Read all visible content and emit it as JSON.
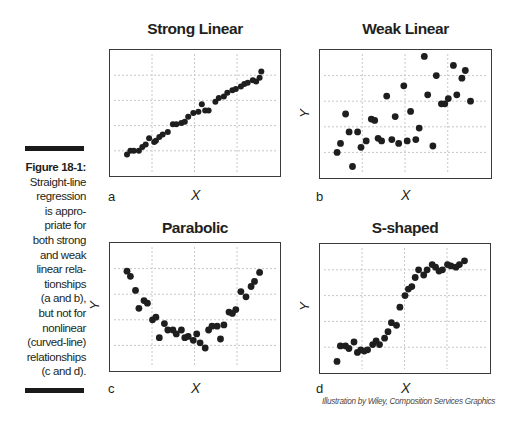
{
  "caption": {
    "figure_number": "Figure 18-1:",
    "lines": [
      "Straight-line",
      "regression",
      "is appro-",
      "priate for",
      "both strong",
      "and weak",
      "linear rela-",
      "tionships",
      "(a and b),",
      "but not for",
      "nonlinear",
      "(curved-line)",
      "relationships",
      "(c and d)."
    ]
  },
  "credit": "Illustration by Wiley, Composition Services Graphics",
  "colors": {
    "point": "#1e1e1e",
    "frame": "#3a3a3a",
    "grid": "#c8c8c8",
    "text": "#231f20"
  },
  "panels": [
    {
      "id": "a",
      "letter": "a",
      "title": "Strong Linear",
      "xlabel": "X",
      "ylabel": "Y"
    },
    {
      "id": "b",
      "letter": "b",
      "title": "Weak Linear",
      "xlabel": "X",
      "ylabel": "Y"
    },
    {
      "id": "c",
      "letter": "c",
      "title": "Parabolic",
      "xlabel": "X",
      "ylabel": "Y"
    },
    {
      "id": "d",
      "letter": "d",
      "title": "S-shaped",
      "xlabel": "X",
      "ylabel": "Y"
    }
  ],
  "chart_data": [
    {
      "type": "scatter",
      "title": "Strong Linear",
      "panel": "a",
      "xlabel": "X",
      "ylabel": "Y",
      "xlim": [
        0,
        100
      ],
      "ylim": [
        0,
        100
      ],
      "grid": true,
      "legend": null,
      "tick_labels": false,
      "points": [
        [
          10,
          17
        ],
        [
          12,
          20
        ],
        [
          14,
          20
        ],
        [
          17,
          20
        ],
        [
          19,
          23
        ],
        [
          21,
          25
        ],
        [
          23,
          30
        ],
        [
          26,
          27
        ],
        [
          27,
          28
        ],
        [
          29,
          31
        ],
        [
          31,
          33
        ],
        [
          34,
          35
        ],
        [
          37,
          41
        ],
        [
          39,
          41
        ],
        [
          42,
          42
        ],
        [
          44,
          43
        ],
        [
          46,
          47
        ],
        [
          49,
          50
        ],
        [
          52,
          51
        ],
        [
          54,
          57
        ],
        [
          56,
          52
        ],
        [
          58,
          52
        ],
        [
          62,
          59
        ],
        [
          64,
          62
        ],
        [
          67,
          63
        ],
        [
          69,
          66
        ],
        [
          72,
          68
        ],
        [
          74,
          69
        ],
        [
          77,
          71
        ],
        [
          79,
          73
        ],
        [
          81,
          74
        ],
        [
          84,
          76
        ],
        [
          86,
          75
        ],
        [
          88,
          78
        ],
        [
          89,
          83
        ]
      ]
    },
    {
      "type": "scatter",
      "title": "Weak Linear",
      "panel": "b",
      "xlabel": "X",
      "ylabel": "Y",
      "xlim": [
        0,
        100
      ],
      "ylim": [
        0,
        100
      ],
      "grid": true,
      "legend": null,
      "tick_labels": false,
      "points": [
        [
          10,
          20
        ],
        [
          12,
          27
        ],
        [
          15,
          50
        ],
        [
          17,
          36
        ],
        [
          19,
          9
        ],
        [
          22,
          36
        ],
        [
          24,
          24
        ],
        [
          27,
          29
        ],
        [
          30,
          46
        ],
        [
          32,
          45
        ],
        [
          34,
          31
        ],
        [
          36,
          29
        ],
        [
          39,
          64
        ],
        [
          42,
          30
        ],
        [
          44,
          48
        ],
        [
          46,
          27
        ],
        [
          49,
          72
        ],
        [
          51,
          29
        ],
        [
          53,
          52
        ],
        [
          56,
          30
        ],
        [
          58,
          39
        ],
        [
          61,
          95
        ],
        [
          63,
          65
        ],
        [
          66,
          25
        ],
        [
          68,
          80
        ],
        [
          71,
          58
        ],
        [
          73,
          58
        ],
        [
          75,
          62
        ],
        [
          78,
          88
        ],
        [
          80,
          65
        ],
        [
          83,
          78
        ],
        [
          85,
          84
        ],
        [
          88,
          60
        ]
      ]
    },
    {
      "type": "scatter",
      "title": "Parabolic",
      "panel": "c",
      "xlabel": "X",
      "ylabel": "Y",
      "xlim": [
        0,
        100
      ],
      "ylim": [
        0,
        100
      ],
      "grid": true,
      "legend": null,
      "tick_labels": false,
      "points": [
        [
          10,
          78
        ],
        [
          12,
          74
        ],
        [
          15,
          63
        ],
        [
          17,
          49
        ],
        [
          20,
          55
        ],
        [
          22,
          53
        ],
        [
          25,
          40
        ],
        [
          27,
          42
        ],
        [
          29,
          26
        ],
        [
          32,
          37
        ],
        [
          34,
          32
        ],
        [
          37,
          32
        ],
        [
          39,
          29
        ],
        [
          42,
          32
        ],
        [
          44,
          26
        ],
        [
          46,
          27
        ],
        [
          49,
          24
        ],
        [
          51,
          29
        ],
        [
          53,
          22
        ],
        [
          56,
          18
        ],
        [
          58,
          32
        ],
        [
          60,
          35
        ],
        [
          63,
          35
        ],
        [
          65,
          25
        ],
        [
          67,
          36
        ],
        [
          70,
          46
        ],
        [
          72,
          45
        ],
        [
          74,
          48
        ],
        [
          77,
          62
        ],
        [
          80,
          58
        ],
        [
          83,
          66
        ],
        [
          85,
          70
        ],
        [
          88,
          77
        ]
      ]
    },
    {
      "type": "scatter",
      "title": "S-shaped",
      "panel": "d",
      "xlabel": "X",
      "ylabel": "Y",
      "xlim": [
        0,
        100
      ],
      "ylim": [
        0,
        100
      ],
      "grid": true,
      "legend": null,
      "tick_labels": false,
      "points": [
        [
          10,
          9
        ],
        [
          12,
          21
        ],
        [
          15,
          21
        ],
        [
          17,
          19
        ],
        [
          20,
          24
        ],
        [
          22,
          16
        ],
        [
          24,
          18
        ],
        [
          26,
          17
        ],
        [
          28,
          18
        ],
        [
          31,
          22
        ],
        [
          33,
          25
        ],
        [
          35,
          22
        ],
        [
          38,
          27
        ],
        [
          40,
          32
        ],
        [
          42,
          39
        ],
        [
          45,
          37
        ],
        [
          47,
          51
        ],
        [
          50,
          60
        ],
        [
          52,
          65
        ],
        [
          54,
          67
        ],
        [
          56,
          74
        ],
        [
          58,
          80
        ],
        [
          61,
          76
        ],
        [
          63,
          80
        ],
        [
          66,
          84
        ],
        [
          68,
          82
        ],
        [
          70,
          79
        ],
        [
          72,
          80
        ],
        [
          75,
          84
        ],
        [
          77,
          83
        ],
        [
          80,
          82
        ],
        [
          82,
          84
        ],
        [
          85,
          87
        ]
      ]
    }
  ]
}
